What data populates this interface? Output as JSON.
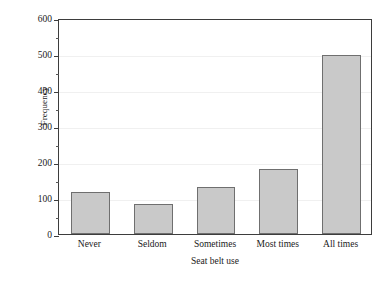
{
  "chart_data": {
    "type": "bar",
    "title": "",
    "subtitle": "",
    "xlabel": "Seat belt use",
    "ylabel": "Frequency",
    "categories": [
      "Never",
      "Seldom",
      "Sometimes",
      "Most times",
      "All times"
    ],
    "values": [
      117,
      83,
      130,
      180,
      497
    ],
    "series": [
      {
        "name": "Frequency",
        "values": [
          117,
          83,
          130,
          180,
          497
        ]
      }
    ],
    "ylim": [
      0,
      600
    ],
    "y_major_ticks": [
      0,
      100,
      200,
      300,
      400,
      500,
      600
    ],
    "y_tick_labels": [
      "0",
      "100",
      "200",
      "300",
      "400",
      "500",
      "600"
    ],
    "y_minor_ticks": [
      50,
      150,
      250,
      350,
      450,
      550
    ],
    "grid": "horizontal-major-only",
    "legend": "none",
    "annotations": [],
    "colors": {
      "bar_fill": "#c9c9c9",
      "bar_border": "#6f6f6f",
      "axis": "#3d3d3d",
      "gridline": "#f0f0f0",
      "text": "#1a1a1a",
      "background": "#ffffff"
    }
  }
}
